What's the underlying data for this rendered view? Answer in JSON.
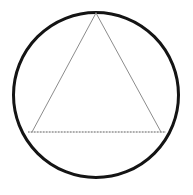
{
  "figure": {
    "title": "Equilateral triangle inscribed in a circle",
    "background_color": "#ffffff",
    "width": 193,
    "height": 195
  },
  "chart_data": {
    "type": "diagram",
    "title": "Equilateral triangle inscribed in a circle",
    "xlabel": "",
    "ylabel": "",
    "xlim": [
      0,
      193
    ],
    "ylim": [
      0,
      195
    ],
    "grid": false,
    "legend": "none",
    "shapes": [
      {
        "name": "circle",
        "kind": "circle",
        "cx": 96,
        "cy": 95,
        "r": 82.5,
        "stroke": "#141414",
        "stroke_width": 3.0,
        "stroke_style": "solid",
        "fill": "none"
      },
      {
        "name": "triangle",
        "kind": "polygon",
        "points": [
          [
            96,
            13
          ],
          [
            32,
            132
          ],
          [
            161,
            132
          ]
        ],
        "vertex_labels": [
          "apex",
          "bottom-left",
          "bottom-right"
        ],
        "stroke": "#8c8c8c",
        "stroke_width": 1.0,
        "stroke_style": "solid",
        "fill": "none"
      },
      {
        "name": "base-chord",
        "kind": "line",
        "x1": 28,
        "y1": 132,
        "x2": 166,
        "y2": 132,
        "stroke": "#555555",
        "stroke_width": 1.0,
        "stroke_style": "dotted",
        "dash_pattern": "1.5 1.5",
        "fill": "none"
      }
    ],
    "annotations": []
  }
}
